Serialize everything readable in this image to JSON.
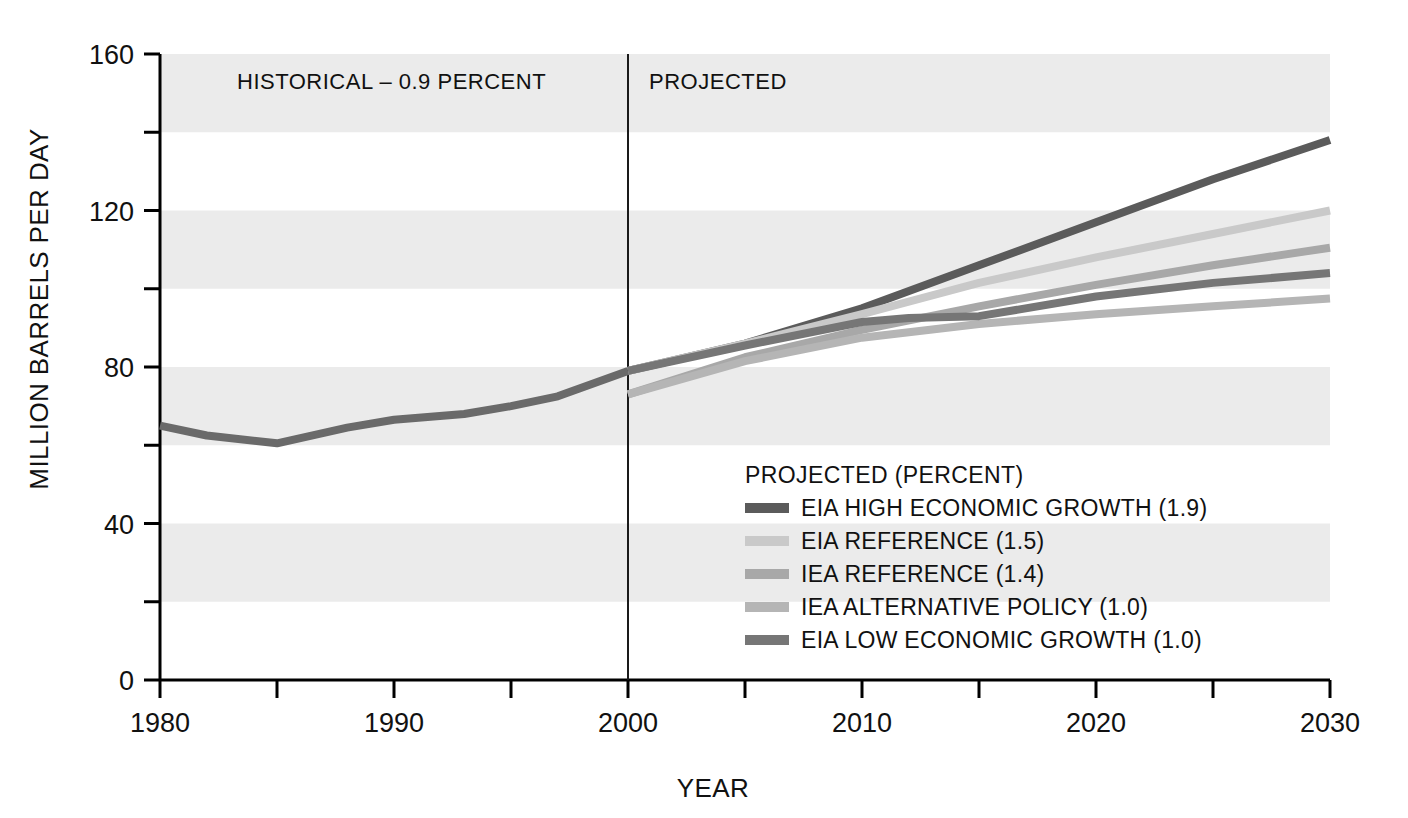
{
  "chart_data": {
    "type": "line",
    "title": "",
    "xlabel": "YEAR",
    "ylabel": "MILLION BARRELS PER DAY",
    "xlim": [
      1980,
      2030
    ],
    "ylim": [
      0,
      160
    ],
    "x_ticks": [
      "1980",
      "1990",
      "2000",
      "2010",
      "2020",
      "2030"
    ],
    "x_tick_values": [
      1980,
      1990,
      2000,
      2010,
      2020,
      2030
    ],
    "x_minor_ticks": [
      1985,
      1995,
      2005,
      2015,
      2025
    ],
    "y_ticks": [
      "0",
      "40",
      "80",
      "120",
      "160"
    ],
    "y_tick_values": [
      0,
      40,
      80,
      120,
      160
    ],
    "y_minor_ticks": [
      20,
      60,
      100,
      140
    ],
    "grid": false,
    "banded_background": true,
    "band_ranges": [
      [
        20,
        40
      ],
      [
        60,
        80
      ],
      [
        100,
        120
      ],
      [
        140,
        160
      ]
    ],
    "band_color": "#ebebeb",
    "divider_year": 2000,
    "annotations": [
      {
        "name": "historical-label",
        "text": "HISTORICAL – 0.9 PERCENT",
        "x": 1996.5,
        "y": 151,
        "anchor": "end"
      },
      {
        "name": "projected-label",
        "text": "PROJECTED",
        "x": 2000.9,
        "y": 151,
        "anchor": "start"
      }
    ],
    "legend": {
      "position": "inside-bottom-right",
      "title": "PROJECTED (PERCENT)",
      "entries": [
        {
          "label": "EIA HIGH ECONOMIC GROWTH (1.9)",
          "color": "#5b5b5b"
        },
        {
          "label": "EIA REFERENCE (1.5)",
          "color": "#c9c9c9"
        },
        {
          "label": "IEA REFERENCE (1.4)",
          "color": "#a8a8a8"
        },
        {
          "label": "IEA ALTERNATIVE POLICY (1.0)",
          "color": "#b5b5b5"
        },
        {
          "label": "EIA LOW ECONOMIC GROWTH (1.0)",
          "color": "#767676"
        }
      ]
    },
    "series": [
      {
        "name": "HISTORICAL",
        "color": "#6a6a6a",
        "historical": true,
        "x": [
          1980,
          1982,
          1985,
          1988,
          1990,
          1993,
          1995,
          1997,
          2000
        ],
        "values": [
          65.0,
          62.5,
          60.5,
          64.5,
          66.5,
          68.0,
          70.0,
          72.5,
          79.0
        ]
      },
      {
        "name": "EIA HIGH ECONOMIC GROWTH (1.9)",
        "color": "#5b5b5b",
        "x": [
          2000,
          2005,
          2010,
          2015,
          2020,
          2025,
          2030
        ],
        "values": [
          79.0,
          86.0,
          95.0,
          106.0,
          117.0,
          128.0,
          138.0
        ]
      },
      {
        "name": "EIA REFERENCE (1.5)",
        "color": "#c9c9c9",
        "x": [
          2000,
          2005,
          2010,
          2015,
          2020,
          2025,
          2030
        ],
        "values": [
          79.0,
          86.0,
          93.5,
          101.5,
          108.0,
          114.0,
          120.0
        ]
      },
      {
        "name": "IEA REFERENCE (1.4)",
        "color": "#a8a8a8",
        "x": [
          2000,
          2005,
          2010,
          2015,
          2020,
          2025,
          2030
        ],
        "values": [
          73.0,
          82.5,
          89.5,
          95.5,
          101.0,
          106.0,
          110.5
        ]
      },
      {
        "name": "IEA ALTERNATIVE POLICY (1.0)",
        "color": "#b5b5b5",
        "x": [
          2000,
          2005,
          2010,
          2015,
          2020,
          2025,
          2030
        ],
        "values": [
          73.0,
          81.5,
          87.5,
          91.0,
          93.5,
          95.5,
          97.5
        ]
      },
      {
        "name": "EIA LOW ECONOMIC GROWTH (1.0)",
        "color": "#767676",
        "x": [
          2000,
          2005,
          2010,
          2012,
          2015,
          2020,
          2025,
          2030
        ],
        "values": [
          79.0,
          85.5,
          91.5,
          92.5,
          93.0,
          98.0,
          101.5,
          104.0
        ]
      }
    ]
  }
}
